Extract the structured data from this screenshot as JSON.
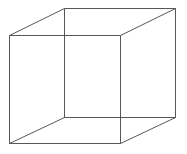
{
  "figure": {
    "type": "necker-cube",
    "stroke_color": "#444444",
    "background": "#ffffff",
    "vertices": {
      "front_top_left": [
        9,
        35
      ],
      "front_top_right": [
        120,
        35
      ],
      "front_bottom_left": [
        9,
        143
      ],
      "front_bottom_right": [
        120,
        143
      ],
      "back_top_left": [
        64,
        8
      ],
      "back_top_right": [
        175,
        8
      ],
      "back_bottom_left": [
        64,
        117
      ],
      "back_bottom_right": [
        175,
        117
      ]
    },
    "edges": [
      [
        "front_top_left",
        "front_top_right"
      ],
      [
        "front_top_right",
        "front_bottom_right"
      ],
      [
        "front_bottom_right",
        "front_bottom_left"
      ],
      [
        "front_bottom_left",
        "front_top_left"
      ],
      [
        "back_top_left",
        "back_top_right"
      ],
      [
        "back_top_right",
        "back_bottom_right"
      ],
      [
        "back_bottom_right",
        "back_bottom_left"
      ],
      [
        "back_bottom_left",
        "back_top_left"
      ],
      [
        "front_top_left",
        "back_top_left"
      ],
      [
        "front_top_right",
        "back_top_right"
      ],
      [
        "front_bottom_left",
        "back_bottom_left"
      ],
      [
        "front_bottom_right",
        "back_bottom_right"
      ]
    ]
  }
}
